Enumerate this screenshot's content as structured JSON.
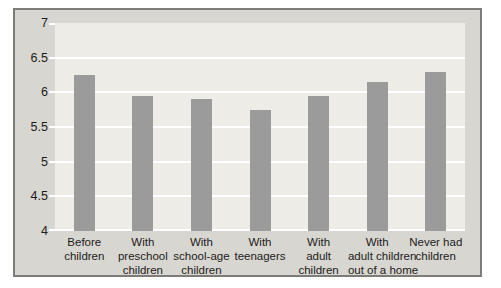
{
  "chart_data": {
    "type": "bar",
    "categories": [
      "Before\nchildren",
      "With\npreschool\nchildren",
      "With\nschool-age\nchildren",
      "With\nteenagers",
      "With\nadult\nchildren",
      "With\nadult children\nout of a home",
      "Never had\nchildren"
    ],
    "values": [
      6.25,
      5.95,
      5.9,
      5.75,
      5.95,
      6.15,
      6.3
    ],
    "title": "",
    "xlabel": "",
    "ylabel": "",
    "ylim": [
      4,
      7
    ],
    "ytick_step": 0.5,
    "ytick_labels": [
      "7",
      "6.5",
      "6",
      "5.5",
      "5",
      "4.5",
      "4"
    ],
    "grid": true,
    "legend": false,
    "bar_width_px": 21,
    "colors": {
      "page_bg": "#ffffff",
      "chart_bg": "#d8d6d0",
      "plot_bg": "#edece7",
      "bar": "#9b9b9b",
      "gridline": "#ffffff",
      "border": "#7d7c78",
      "text": "#1c1c1c"
    }
  }
}
